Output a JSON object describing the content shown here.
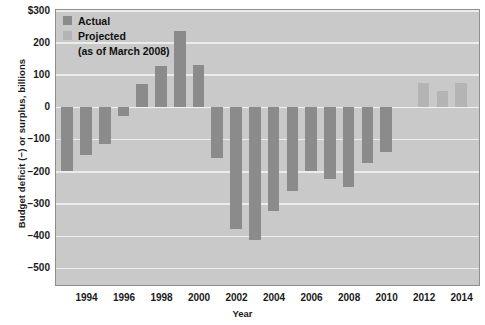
{
  "chart_data": {
    "type": "bar",
    "title": "",
    "xlabel": "Year",
    "ylabel": "Budget deficit (−) or surplus, billions",
    "ylim": [
      -550,
      300
    ],
    "xlim": [
      1992.4,
      2014.9
    ],
    "grid": true,
    "yticks": [
      300,
      200,
      100,
      0,
      -100,
      -200,
      -300,
      -400,
      -500
    ],
    "ytick_labels": [
      "$300",
      "200",
      "100",
      "0",
      "−100",
      "−200",
      "−300",
      "−400",
      "−500"
    ],
    "xticks": [
      1994,
      1996,
      1998,
      2000,
      2002,
      2004,
      2006,
      2008,
      2010,
      2012,
      2014
    ],
    "xtick_labels": [
      "1994",
      "1996",
      "1998",
      "2000",
      "2002",
      "2004",
      "2006",
      "2008",
      "2010",
      "2012",
      "2014"
    ],
    "legend_position": "top-left",
    "series": [
      {
        "name": "Actual",
        "color": "#8b8b8b",
        "x": [
          1993,
          1994,
          1995,
          1996,
          1997,
          1998,
          1999,
          2000,
          2001,
          2002,
          2003,
          2004,
          2005,
          2006,
          2007,
          2008,
          2009,
          2010,
          2011
        ],
        "values": [
          -200,
          -150,
          -115,
          -30,
          70,
          125,
          235,
          128,
          -160,
          -378,
          -413,
          -325,
          -260,
          -200,
          -225,
          -250,
          -175,
          -140,
          0
        ]
      },
      {
        "name": "Projected",
        "color": "#b4b4b4",
        "x": [
          2012,
          2013,
          2014
        ],
        "values": [
          72,
          50,
          72
        ]
      }
    ],
    "legend": [
      {
        "label": "Actual",
        "color": "#8b8b8b"
      },
      {
        "label": "Projected",
        "color": "#b4b4b4"
      }
    ],
    "legend_note": "(as of March 2008)",
    "bars": [
      {
        "year": 1993,
        "value": -200,
        "kind": "actual"
      },
      {
        "year": 1994,
        "value": -150,
        "kind": "actual"
      },
      {
        "year": 1995,
        "value": -115,
        "kind": "actual"
      },
      {
        "year": 1996,
        "value": -30,
        "kind": "actual"
      },
      {
        "year": 1997,
        "value": 70,
        "kind": "actual"
      },
      {
        "year": 1998,
        "value": 125,
        "kind": "actual"
      },
      {
        "year": 1999,
        "value": 235,
        "kind": "actual"
      },
      {
        "year": 2000,
        "value": 128,
        "kind": "actual"
      },
      {
        "year": 2001,
        "value": -160,
        "kind": "actual"
      },
      {
        "year": 2002,
        "value": -378,
        "kind": "actual"
      },
      {
        "year": 2003,
        "value": -413,
        "kind": "actual"
      },
      {
        "year": 2004,
        "value": -325,
        "kind": "actual"
      },
      {
        "year": 2005,
        "value": -260,
        "kind": "actual"
      },
      {
        "year": 2006,
        "value": -200,
        "kind": "actual"
      },
      {
        "year": 2007,
        "value": -225,
        "kind": "actual"
      },
      {
        "year": 2008,
        "value": -250,
        "kind": "actual"
      },
      {
        "year": 2009,
        "value": -175,
        "kind": "actual"
      },
      {
        "year": 2010,
        "value": -140,
        "kind": "actual"
      },
      {
        "year": 2012,
        "value": 72,
        "kind": "projected"
      },
      {
        "year": 2013,
        "value": 50,
        "kind": "projected"
      },
      {
        "year": 2014,
        "value": 72,
        "kind": "projected"
      }
    ]
  }
}
